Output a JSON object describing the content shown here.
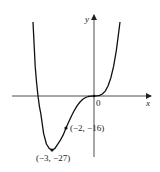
{
  "chart_data": {
    "type": "line",
    "title": "",
    "function": "y = x^4 + 4x^3",
    "xlabel": "x",
    "ylabel": "y",
    "origin_label": "0",
    "xlim": [
      -5.8,
      4.1
    ],
    "ylim": [
      -33,
      37
    ],
    "grid": false,
    "legend": null,
    "series": [
      {
        "name": "curve",
        "x": [
          -4.2,
          -4.1,
          -4.0,
          -3.9,
          -3.8,
          -3.6,
          -3.4,
          -3.2,
          -3.0,
          -2.8,
          -2.6,
          -2.4,
          -2.2,
          -2.0,
          -1.8,
          -1.6,
          -1.4,
          -1.2,
          -1.0,
          -0.8,
          -0.6,
          -0.4,
          -0.2,
          0.0,
          0.2,
          0.4,
          0.6,
          0.8,
          1.0,
          1.2,
          1.4,
          1.6,
          1.8,
          1.9
        ],
        "y": [
          14.82,
          6.65,
          0.0,
          -5.14,
          -8.86,
          -18.66,
          -24.01,
          -26.21,
          -27.0,
          -26.34,
          -24.14,
          -22.12,
          -19.43,
          -16.0,
          -12.83,
          -9.83,
          -7.13,
          -4.84,
          -3.0,
          -1.64,
          -0.73,
          -0.23,
          -0.03,
          0.0,
          0.03,
          0.28,
          0.99,
          2.46,
          5.0,
          8.99,
          14.82,
          22.94,
          33.83,
          40.47
        ]
      }
    ],
    "annotations": [
      {
        "label": "(−2, −16)",
        "x": -2,
        "y": -16
      },
      {
        "label": "(−3, −27)",
        "x": -3,
        "y": -27
      },
      {
        "label": "0",
        "x": 0,
        "y": 0
      }
    ]
  },
  "labels": {
    "x_axis": "x",
    "y_axis": "y",
    "origin": "0",
    "point_inflection": "(−2, −16)",
    "point_minimum": "(−3, −27)"
  },
  "colors": {
    "curve": "#111111",
    "axes": "#222222",
    "background": "#ffffff"
  }
}
